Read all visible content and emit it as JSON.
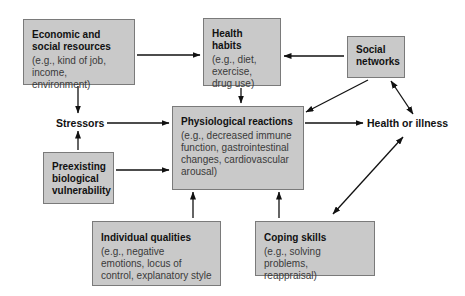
{
  "diagram": {
    "nodes": {
      "economic": {
        "title_line1": "Economic and",
        "title_line2": "social resources",
        "desc_line1": "(e.g., kind of job,",
        "desc_line2": "income, environment)"
      },
      "health_habits": {
        "title": "Health habits",
        "desc_line1": "(e.g., diet,",
        "desc_line2": "exercise,",
        "desc_line3": "drug use)"
      },
      "social_networks": {
        "title_line1": "Social",
        "title_line2": "networks"
      },
      "stressors": {
        "label": "Stressors"
      },
      "physiological": {
        "title": "Physiological reactions",
        "desc_line1": "(e.g., decreased immune",
        "desc_line2": "function, gastrointestinal",
        "desc_line3": "changes, cardiovascular",
        "desc_line4": "arousal)"
      },
      "health_or_illness": {
        "label": "Health or illness"
      },
      "preexisting": {
        "title_line1": "Preexisting",
        "title_line2": "biological",
        "title_line3": "vulnerability"
      },
      "individual": {
        "title": "Individual qualities",
        "desc_line1": "(e.g., negative",
        "desc_line2": "emotions, locus of",
        "desc_line3": "control, explanatory style"
      },
      "coping": {
        "title": "Coping skills",
        "desc_line1": "(e.g., solving problems,",
        "desc_line2": "reappraisal)"
      }
    },
    "edges": [
      {
        "from": "economic",
        "to": "health_habits",
        "type": "arrow"
      },
      {
        "from": "economic",
        "to": "stressors",
        "type": "arrow"
      },
      {
        "from": "social_networks",
        "to": "health_habits",
        "type": "arrow"
      },
      {
        "from": "social_networks",
        "to": "physiological",
        "type": "arrow"
      },
      {
        "from": "social_networks",
        "to": "health_or_illness",
        "type": "bidirectional"
      },
      {
        "from": "health_habits",
        "to": "physiological",
        "type": "arrow"
      },
      {
        "from": "stressors",
        "to": "physiological",
        "type": "arrow"
      },
      {
        "from": "preexisting",
        "to": "stressors",
        "type": "arrow"
      },
      {
        "from": "preexisting",
        "to": "physiological",
        "type": "arrow"
      },
      {
        "from": "physiological",
        "to": "health_or_illness",
        "type": "arrow"
      },
      {
        "from": "individual",
        "to": "physiological",
        "type": "arrow"
      },
      {
        "from": "coping",
        "to": "physiological",
        "type": "arrow"
      },
      {
        "from": "coping",
        "to": "health_or_illness",
        "type": "bidirectional"
      }
    ],
    "colors": {
      "box_fill": "#c9c9c9",
      "box_border": "#7a7a7a",
      "arrow": "#111111",
      "background": "#ffffff"
    }
  }
}
